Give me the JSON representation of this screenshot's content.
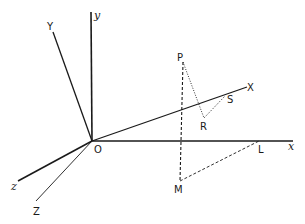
{
  "diagram": {
    "type": "3D coordinate axes with projected point construction",
    "colors": {
      "ink": "#1a1a1a",
      "background": "#ffffff"
    },
    "origin": {
      "label": "O",
      "x": 92,
      "y": 141
    },
    "axes": [
      {
        "id": "y",
        "label": "y",
        "style": "solid-thick",
        "from": [
          92,
          141
        ],
        "to": [
          91,
          12
        ],
        "label_pos": [
          94,
          19
        ],
        "italic": true
      },
      {
        "id": "x",
        "label": "x",
        "style": "solid-thick",
        "from": [
          92,
          141
        ],
        "to": [
          293,
          141
        ],
        "label_pos": [
          288,
          150
        ],
        "italic": true
      },
      {
        "id": "z",
        "label": "z",
        "style": "solid-thick",
        "from": [
          92,
          141
        ],
        "to": [
          18,
          181
        ],
        "label_pos": [
          11,
          190
        ],
        "italic": true
      },
      {
        "id": "Y",
        "label": "Y",
        "style": "solid",
        "from": [
          92,
          141
        ],
        "to": [
          53,
          32
        ],
        "label_pos": [
          47,
          30
        ],
        "italic": false
      },
      {
        "id": "X",
        "label": "X",
        "style": "solid",
        "from": [
          92,
          141
        ],
        "to": [
          247,
          87
        ],
        "label_pos": [
          247,
          91
        ],
        "italic": false
      },
      {
        "id": "Z",
        "label": "Z",
        "style": "solid-thin",
        "from": [
          92,
          141
        ],
        "to": [
          36,
          201
        ],
        "label_pos": [
          33,
          215
        ],
        "italic": false
      }
    ],
    "points": [
      {
        "label": "P",
        "x": 183,
        "y": 62,
        "label_pos": [
          177,
          61
        ]
      },
      {
        "label": "R",
        "x": 204,
        "y": 118,
        "label_pos": [
          200,
          130
        ]
      },
      {
        "label": "S",
        "x": 225,
        "y": 96,
        "label_pos": [
          227,
          103
        ]
      },
      {
        "label": "L",
        "x": 259,
        "y": 141,
        "label_pos": [
          258,
          153
        ]
      },
      {
        "label": "M",
        "x": 180,
        "y": 181,
        "label_pos": [
          174,
          193
        ]
      }
    ],
    "segments": [
      {
        "from": "P",
        "to": "M",
        "style": "dashed"
      },
      {
        "from": "M",
        "to": "L",
        "style": "dashed"
      },
      {
        "from": "P",
        "to": "R",
        "style": "dotted"
      },
      {
        "from": "R",
        "to": "S",
        "style": "dotted"
      }
    ],
    "labels": {
      "O": "O",
      "y": "y",
      "x": "x",
      "z": "z",
      "Y": "Y",
      "X": "X",
      "Z": "Z",
      "P": "P",
      "R": "R",
      "S": "S",
      "L": "L",
      "M": "M"
    }
  }
}
